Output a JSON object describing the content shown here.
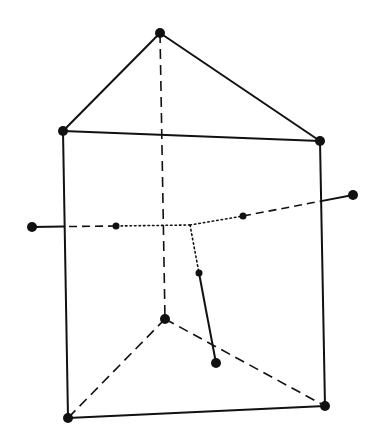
{
  "diagram": {
    "line_color": "#111111",
    "background": "#ffffff",
    "prism_vertices": [
      {
        "id": "top-apex",
        "x": 160,
        "y": 33,
        "r": 5
      },
      {
        "id": "upper-left",
        "x": 63,
        "y": 131,
        "r": 5
      },
      {
        "id": "upper-right",
        "x": 320,
        "y": 141,
        "r": 5
      },
      {
        "id": "lower-back",
        "x": 165,
        "y": 319,
        "r": 5
      },
      {
        "id": "lower-left",
        "x": 68,
        "y": 418,
        "r": 5
      },
      {
        "id": "lower-right",
        "x": 325,
        "y": 406,
        "r": 5
      }
    ],
    "prism_edges_solid": [
      [
        "top-apex",
        "upper-left"
      ],
      [
        "top-apex",
        "upper-right"
      ],
      [
        "upper-left",
        "upper-right"
      ],
      [
        "upper-left",
        "lower-left"
      ],
      [
        "upper-right",
        "lower-right"
      ],
      [
        "lower-left",
        "lower-right"
      ]
    ],
    "prism_edges_hidden": [
      [
        "top-apex",
        "lower-back"
      ],
      [
        "lower-back",
        "lower-left"
      ],
      [
        "lower-back",
        "lower-right"
      ]
    ],
    "molecule": {
      "center": {
        "x": 190,
        "y": 225
      },
      "ligands": [
        {
          "id": "left",
          "inner": {
            "x": 116,
            "y": 226,
            "r": 3.5
          },
          "outer": {
            "x": 32,
            "y": 227,
            "r": 5
          }
        },
        {
          "id": "right",
          "inner": {
            "x": 243,
            "y": 216,
            "r": 3.5
          },
          "outer": {
            "x": 353,
            "y": 195,
            "r": 5
          }
        },
        {
          "id": "down",
          "inner": {
            "x": 199,
            "y": 273,
            "r": 3.5
          },
          "outer": {
            "x": 216,
            "y": 363,
            "r": 5
          }
        }
      ]
    }
  }
}
